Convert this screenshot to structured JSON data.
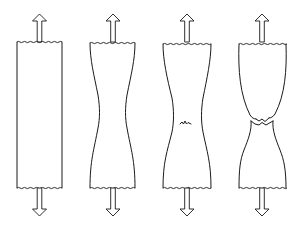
{
  "diagram": {
    "title": "Stages of tensile specimen deformation to fracture",
    "stroke_color": "#1a1a1a",
    "background": "#ffffff",
    "specimens": [
      {
        "id": 1,
        "stage": "uniform elongation",
        "label": "Uniform bar under tension"
      },
      {
        "id": 2,
        "stage": "necking",
        "label": "Neck forms at mid-length"
      },
      {
        "id": 3,
        "stage": "crack initiation",
        "label": "Small crack appears in the neck"
      },
      {
        "id": 4,
        "stage": "fracture",
        "label": "Cup-and-cone fracture"
      }
    ],
    "load_arrows": "Tensile load applied at both ends (up and down arrows)"
  }
}
